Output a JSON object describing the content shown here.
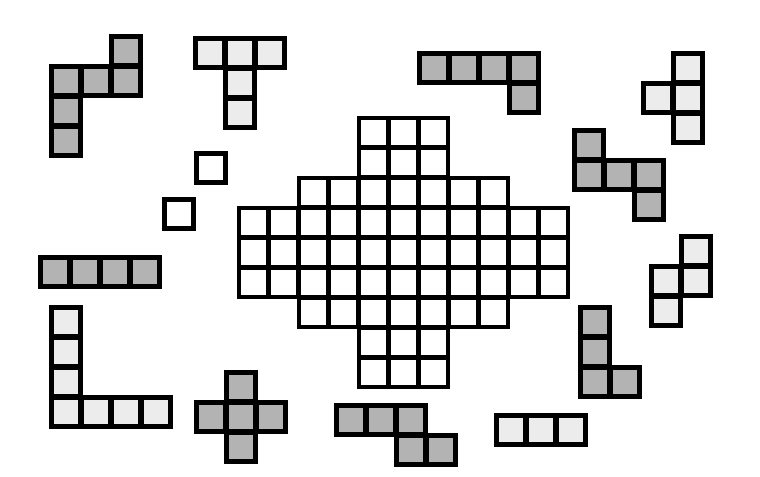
{
  "colors": {
    "dark": "#b3b3b3",
    "light": "#ececec",
    "empty": "#ffffff",
    "outline": "#000000"
  },
  "cell_size": 30,
  "board": {
    "origin": [
      237,
      116
    ],
    "rows": [
      [
        4,
        6
      ],
      [
        4,
        6
      ],
      [
        2,
        8
      ],
      [
        0,
        10
      ],
      [
        0,
        10
      ],
      [
        0,
        10
      ],
      [
        2,
        8
      ],
      [
        4,
        6
      ],
      [
        4,
        6
      ]
    ]
  },
  "pieces": [
    {
      "name": "piece-hexomino-top-left",
      "shade": "dark",
      "origin": [
        49,
        34
      ],
      "cells": [
        [
          0,
          2
        ],
        [
          1,
          0
        ],
        [
          1,
          1
        ],
        [
          1,
          2
        ],
        [
          2,
          0
        ],
        [
          3,
          0
        ]
      ]
    },
    {
      "name": "piece-t-pentomino-top",
      "shade": "light",
      "origin": [
        193,
        36
      ],
      "cells": [
        [
          0,
          0
        ],
        [
          0,
          1
        ],
        [
          0,
          2
        ],
        [
          1,
          1
        ],
        [
          2,
          1
        ]
      ]
    },
    {
      "name": "piece-l-pentomino-top",
      "shade": "dark",
      "origin": [
        417,
        51
      ],
      "cells": [
        [
          0,
          0
        ],
        [
          0,
          1
        ],
        [
          0,
          2
        ],
        [
          0,
          3
        ],
        [
          1,
          3
        ]
      ]
    },
    {
      "name": "piece-t-tetromino-right",
      "shade": "light",
      "origin": [
        641,
        51
      ],
      "cells": [
        [
          0,
          1
        ],
        [
          1,
          0
        ],
        [
          1,
          1
        ],
        [
          2,
          1
        ]
      ]
    },
    {
      "name": "piece-z-pentomino-right",
      "shade": "dark",
      "origin": [
        572,
        128
      ],
      "cells": [
        [
          0,
          0
        ],
        [
          1,
          0
        ],
        [
          1,
          1
        ],
        [
          1,
          2
        ],
        [
          2,
          2
        ]
      ]
    },
    {
      "name": "piece-monomino-1",
      "shade": "empty",
      "origin": [
        194,
        151
      ],
      "cells": [
        [
          0,
          0
        ]
      ]
    },
    {
      "name": "piece-monomino-2",
      "shade": "empty",
      "origin": [
        162,
        197
      ],
      "cells": [
        [
          0,
          0
        ]
      ]
    },
    {
      "name": "piece-i-tetromino-left",
      "shade": "dark",
      "origin": [
        38,
        255
      ],
      "cells": [
        [
          0,
          0
        ],
        [
          0,
          1
        ],
        [
          0,
          2
        ],
        [
          0,
          3
        ]
      ]
    },
    {
      "name": "piece-s-tetromino-right",
      "shade": "light",
      "origin": [
        649,
        234
      ],
      "cells": [
        [
          0,
          1
        ],
        [
          1,
          0
        ],
        [
          1,
          1
        ],
        [
          2,
          0
        ]
      ]
    },
    {
      "name": "piece-l-heptomino-bottom-left",
      "shade": "light",
      "origin": [
        49,
        305
      ],
      "cells": [
        [
          0,
          0
        ],
        [
          1,
          0
        ],
        [
          2,
          0
        ],
        [
          3,
          0
        ],
        [
          3,
          1
        ],
        [
          3,
          2
        ],
        [
          3,
          3
        ]
      ]
    },
    {
      "name": "piece-plus-pentomino",
      "shade": "dark",
      "origin": [
        194,
        370
      ],
      "cells": [
        [
          0,
          1
        ],
        [
          1,
          0
        ],
        [
          1,
          1
        ],
        [
          1,
          2
        ],
        [
          2,
          1
        ]
      ]
    },
    {
      "name": "piece-n-pentomino-bottom",
      "shade": "dark",
      "origin": [
        334,
        403
      ],
      "cells": [
        [
          0,
          0
        ],
        [
          0,
          1
        ],
        [
          0,
          2
        ],
        [
          1,
          2
        ],
        [
          1,
          3
        ]
      ]
    },
    {
      "name": "piece-l-tetromino-bottom-right",
      "shade": "dark",
      "origin": [
        578,
        305
      ],
      "cells": [
        [
          0,
          0
        ],
        [
          1,
          0
        ],
        [
          2,
          0
        ],
        [
          2,
          1
        ]
      ]
    },
    {
      "name": "piece-i-tromino-bottom",
      "shade": "light",
      "origin": [
        494,
        413
      ],
      "cells": [
        [
          0,
          0
        ],
        [
          0,
          1
        ],
        [
          0,
          2
        ]
      ]
    }
  ]
}
